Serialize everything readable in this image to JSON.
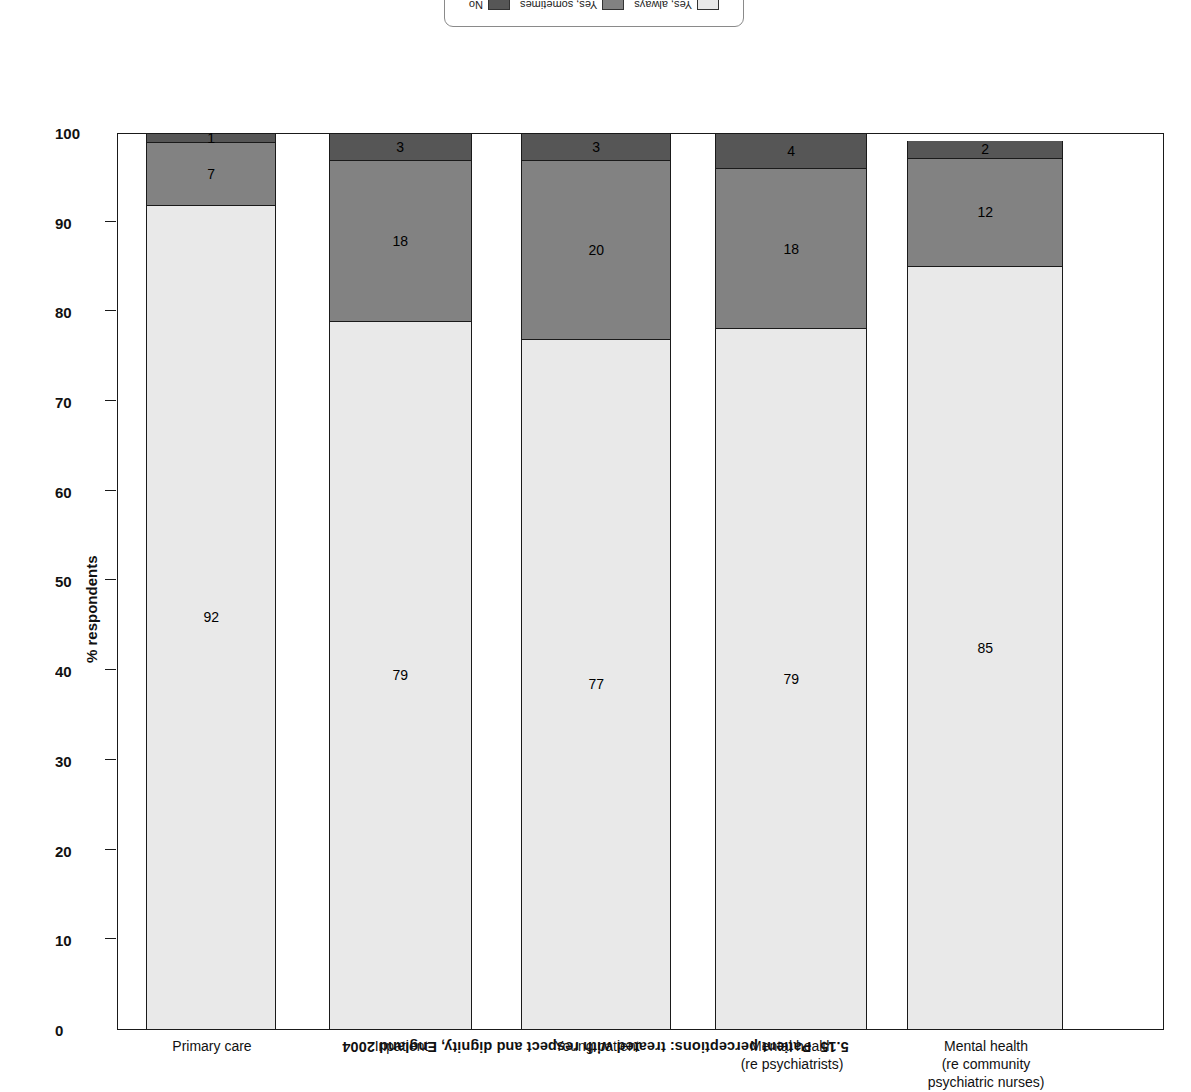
{
  "caption": {
    "number": "5.15",
    "text": "Patient perceptions: treated with respect and dignity, England 2004"
  },
  "axis": {
    "y_title": "% respondents",
    "y_ticks": [
      "0",
      "10",
      "20",
      "30",
      "40",
      "50",
      "60",
      "70",
      "80",
      "90",
      "100"
    ]
  },
  "legend": {
    "items": [
      {
        "label": "Yes, always",
        "color": "#e9e9e9"
      },
      {
        "label": "Yes, sometimes",
        "color": "#828282"
      },
      {
        "label": "No",
        "color": "#565656"
      }
    ]
  },
  "colors": {
    "light": "#e9e9e9",
    "mid": "#828282",
    "dark": "#565656",
    "axis": "#1a1a1a"
  },
  "chart_data": {
    "type": "bar",
    "xlabel": "",
    "ylabel": "% respondents",
    "ylim": [
      0,
      100
    ],
    "grid": false,
    "stacked": true,
    "orientation": "vertical-inverted",
    "legend_position": "top",
    "categories": [
      "Primary care",
      "Inpatient",
      "Young patient",
      "Mental health (re psychiatrists)",
      "Mental health (re community psychiatric nurses)"
    ],
    "category_lines": [
      [
        "Primary care"
      ],
      [
        "Inpatient"
      ],
      [
        "Young patient"
      ],
      [
        "Mental health",
        "(re psychiatrists)"
      ],
      [
        "Mental health",
        "(re community",
        "psychiatric nurses)"
      ]
    ],
    "series": [
      {
        "name": "Yes, always",
        "values": [
          92,
          79,
          77,
          79,
          85
        ]
      },
      {
        "name": "Yes, sometimes",
        "values": [
          7,
          18,
          20,
          18,
          12
        ]
      },
      {
        "name": "No",
        "values": [
          1,
          3,
          3,
          4,
          2
        ]
      }
    ]
  }
}
